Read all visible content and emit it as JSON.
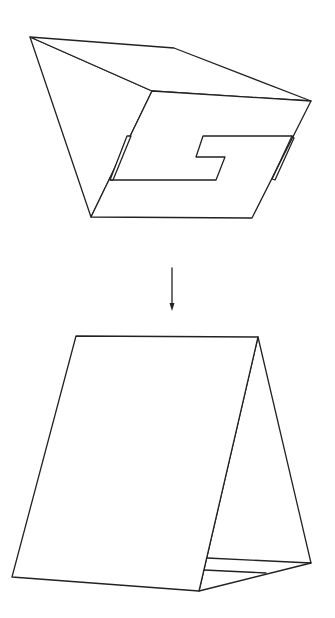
{
  "diagram": {
    "type": "folding-instruction",
    "colors": {
      "stroke": "#222222",
      "background": "#ffffff"
    },
    "steps": [
      {
        "id": "step-1",
        "label": "",
        "shape": "folded card with S cutout"
      },
      {
        "id": "step-2",
        "label": "",
        "shape": "tent card standing"
      }
    ],
    "arrow": {
      "direction": "down",
      "icon": "arrow-down-icon"
    }
  }
}
